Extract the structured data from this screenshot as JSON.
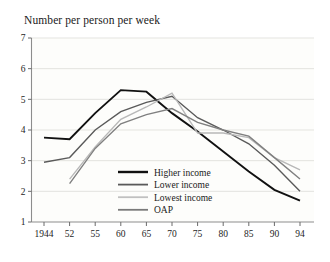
{
  "chart_data": {
    "type": "line",
    "title": "Number per person per week",
    "xlabel": "",
    "ylabel": "Number per person per week",
    "x": [
      "1944",
      "52",
      "55",
      "60",
      "65",
      "70",
      "75",
      "80",
      "85",
      "90",
      "94"
    ],
    "xtick_labels": [
      "1944",
      "52",
      "55",
      "60",
      "65",
      "70",
      "75",
      "80",
      "85",
      "90",
      "94"
    ],
    "ytick_labels": [
      "7",
      "6",
      "5",
      "4",
      "3",
      "2",
      "1"
    ],
    "ylim": [
      1,
      7
    ],
    "grid": "horizontal",
    "legend_position": "center-bottom-inside",
    "series": [
      {
        "name": "Higher income",
        "color": "#111111",
        "width": 1.9,
        "values": [
          3.75,
          3.7,
          4.55,
          5.3,
          5.25,
          4.55,
          3.95,
          3.3,
          2.65,
          2.05,
          1.7
        ]
      },
      {
        "name": "Lower income",
        "color": "#5a5a5a",
        "width": 1.4,
        "values": [
          2.95,
          3.1,
          4.0,
          4.6,
          4.9,
          5.1,
          4.4,
          4.0,
          3.55,
          2.85,
          2.0
        ]
      },
      {
        "name": "Lowest income",
        "color": "#b8b8b8",
        "width": 1.4,
        "values": [
          null,
          2.4,
          3.45,
          4.35,
          4.75,
          5.2,
          3.9,
          3.9,
          3.75,
          3.1,
          2.7
        ]
      },
      {
        "name": "OAP",
        "color": "#808080",
        "width": 1.4,
        "values": [
          null,
          2.25,
          3.4,
          4.2,
          4.5,
          4.7,
          4.25,
          4.0,
          3.8,
          3.1,
          2.4
        ]
      }
    ]
  },
  "legend": {
    "items": [
      {
        "label": "Higher income",
        "color": "#111111",
        "width": 2.4
      },
      {
        "label": "Lower income",
        "color": "#5a5a5a",
        "width": 1.8
      },
      {
        "label": "Lowest income",
        "color": "#c0c0c0",
        "width": 1.8
      },
      {
        "label": "OAP",
        "color": "#7a7a7a",
        "width": 1.8
      }
    ]
  }
}
